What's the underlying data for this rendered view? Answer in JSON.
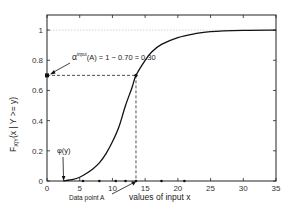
{
  "chart_data": {
    "type": "line",
    "title": "",
    "xlabel": "values of input x",
    "ylabel": "F_X|Y(x | Y >= y)",
    "ylabel_main": "F",
    "ylabel_sub": "X|Y",
    "ylabel_rest": "(x | Y >= y)",
    "xlim": [
      0,
      35
    ],
    "ylim": [
      0,
      1.1
    ],
    "x_ticks": [
      0,
      5,
      10,
      15,
      20,
      25,
      30,
      35
    ],
    "x_tick_labels": [
      "0",
      "5",
      "10",
      "15",
      "20",
      "25",
      "30",
      "35"
    ],
    "y_ticks": [
      0,
      0.2,
      0.4,
      0.6,
      0.8,
      1
    ],
    "y_tick_labels": [
      "0",
      "0.2",
      "0.4",
      "0.6",
      "0.8",
      "1"
    ],
    "grid": false,
    "reference_line_y": 1,
    "series": [
      {
        "name": "conditional CDF",
        "x": [
          2.5,
          4,
          5,
          6,
          7,
          8,
          9,
          10,
          11,
          12,
          13,
          13.6,
          15,
          16,
          17.5,
          20,
          22.5,
          25,
          30,
          35
        ],
        "y": [
          0,
          0.01,
          0.025,
          0.05,
          0.08,
          0.12,
          0.18,
          0.26,
          0.36,
          0.5,
          0.62,
          0.7,
          0.8,
          0.855,
          0.905,
          0.95,
          0.975,
          0.99,
          0.998,
          1.0
        ]
      }
    ],
    "data_points_on_axis": [
      5.5,
      8,
      10.5,
      12,
      13.6,
      17.5,
      21
    ],
    "data_point_A": {
      "x": 13.6,
      "y": 0.7,
      "label": "Data point A"
    },
    "phi_y": {
      "x": 2.5,
      "label": "φ(y)"
    },
    "annotations": {
      "alpha_prefix": "α",
      "alpha_superscript": "input",
      "alpha_rest": "(A) = 1 − 0.70 = 0.30",
      "phi_label": "φ(y)",
      "data_point_label": "Data point A"
    }
  }
}
